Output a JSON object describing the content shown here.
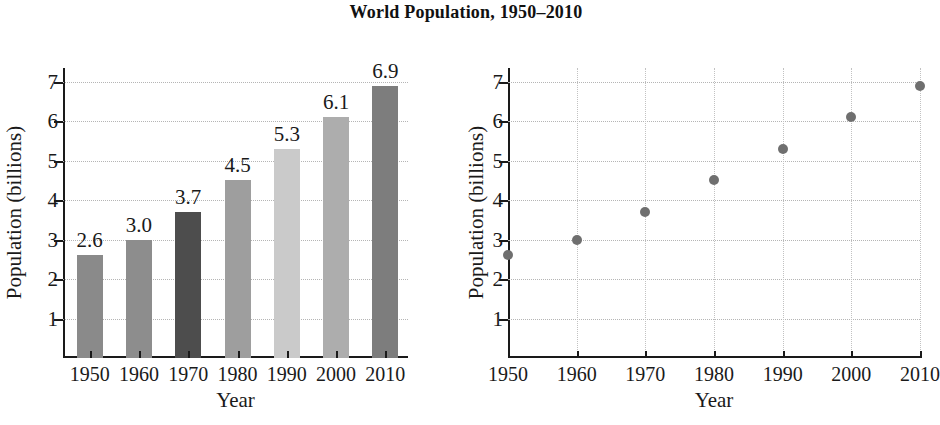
{
  "title": "World Population, 1950–2010",
  "chart_data": [
    {
      "type": "bar",
      "title": "World Population, 1950–2010",
      "xlabel": "Year",
      "ylabel": "Population (billions)",
      "categories": [
        "1950",
        "1960",
        "1970",
        "1980",
        "1990",
        "2000",
        "2010"
      ],
      "values": [
        2.6,
        3.0,
        3.7,
        4.5,
        5.3,
        6.1,
        6.9
      ],
      "data_labels": [
        "2.6",
        "3.0",
        "3.7",
        "4.5",
        "5.3",
        "6.1",
        "6.9"
      ],
      "bar_colors": [
        "#8a8a8a",
        "#8d8d8d",
        "#4d4d4d",
        "#9e9e9e",
        "#cacaca",
        "#adadad",
        "#7d7d7d"
      ],
      "ylim": [
        0,
        7.35
      ],
      "yticks": [
        1,
        2,
        3,
        4,
        5,
        6,
        7
      ],
      "ytick_labels": [
        "1",
        "2",
        "3",
        "4",
        "5",
        "6",
        "7"
      ],
      "grid": "horizontal-dotted",
      "legend": "none"
    },
    {
      "type": "scatter",
      "title": "World Population, 1950–2010",
      "xlabel": "Year",
      "ylabel": "Population (billions)",
      "x": [
        "1950",
        "1960",
        "1970",
        "1980",
        "1990",
        "2000",
        "2010"
      ],
      "y": [
        2.6,
        3.0,
        3.7,
        4.5,
        5.3,
        6.1,
        6.9
      ],
      "marker_color": "#6f6f6f",
      "ylim": [
        0,
        7.35
      ],
      "yticks": [
        1,
        2,
        3,
        4,
        5,
        6,
        7
      ],
      "ytick_labels": [
        "1",
        "2",
        "3",
        "4",
        "5",
        "6",
        "7"
      ],
      "grid": "both-dotted",
      "legend": "none"
    }
  ],
  "bar_chart": {
    "xlabel": "Year",
    "ylabel": "Population (billions)"
  },
  "scatter_chart": {
    "xlabel": "Year",
    "ylabel": "Population (billions)"
  }
}
